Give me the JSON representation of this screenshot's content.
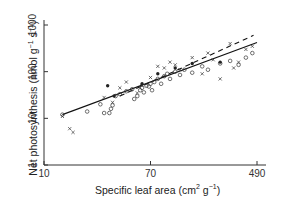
{
  "chart_data": {
    "type": "scatter",
    "title": "",
    "xlabel": "Specific leaf area (cm² g⁻¹)",
    "ylabel": "Net photosynthesis (nmol g⁻¹ s⁻¹)",
    "xscale": "log",
    "yscale": "log",
    "xlim": [
      10,
      560
    ],
    "ylim": [
      1,
      1000
    ],
    "x_ticks": [
      10,
      70,
      490
    ],
    "y_ticks": [
      1,
      10,
      100,
      1000
    ],
    "grid": false,
    "legend": "none",
    "series": [
      {
        "name": "open circles",
        "marker": "o",
        "points": [
          [
            14,
            12
          ],
          [
            22,
            14
          ],
          [
            28,
            20
          ],
          [
            30,
            13
          ],
          [
            33,
            13
          ],
          [
            34,
            16
          ],
          [
            35,
            19
          ],
          [
            37,
            30
          ],
          [
            40,
            33
          ],
          [
            45,
            38
          ],
          [
            50,
            42
          ],
          [
            52,
            26
          ],
          [
            55,
            30
          ],
          [
            58,
            40
          ],
          [
            60,
            45
          ],
          [
            62,
            36
          ],
          [
            65,
            50
          ],
          [
            68,
            48
          ],
          [
            70,
            55
          ],
          [
            72,
            40
          ],
          [
            75,
            60
          ],
          [
            80,
            70
          ],
          [
            85,
            55
          ],
          [
            90,
            80
          ],
          [
            95,
            90
          ],
          [
            100,
            70
          ],
          [
            110,
            100
          ],
          [
            120,
            85
          ],
          [
            130,
            110
          ],
          [
            150,
            95
          ],
          [
            180,
            130
          ],
          [
            200,
            110
          ],
          [
            250,
            150
          ],
          [
            300,
            170
          ],
          [
            350,
            140
          ],
          [
            400,
            200
          ],
          [
            450,
            250
          ]
        ]
      },
      {
        "name": "crosses",
        "marker": "x",
        "points": [
          [
            14,
            11
          ],
          [
            16,
            6
          ],
          [
            17,
            5
          ],
          [
            30,
            28
          ],
          [
            35,
            22
          ],
          [
            40,
            45
          ],
          [
            45,
            60
          ],
          [
            55,
            35
          ],
          [
            60,
            50
          ],
          [
            70,
            75
          ],
          [
            80,
            130
          ],
          [
            90,
            120
          ],
          [
            100,
            160
          ],
          [
            110,
            140
          ],
          [
            120,
            110
          ],
          [
            150,
            200
          ],
          [
            180,
            90
          ],
          [
            200,
            250
          ],
          [
            220,
            180
          ],
          [
            250,
            70
          ],
          [
            300,
            400
          ],
          [
            320,
            120
          ],
          [
            350,
            160
          ],
          [
            400,
            300
          ],
          [
            450,
            350
          ]
        ]
      },
      {
        "name": "filled points",
        "marker": "•",
        "points": [
          [
            32,
            50
          ],
          [
            36,
            30
          ],
          [
            60,
            55
          ],
          [
            80,
            90
          ],
          [
            110,
            120
          ],
          [
            150,
            150
          ],
          [
            250,
            160
          ]
        ]
      }
    ],
    "fit_lines": [
      {
        "name": "solid fit",
        "style": "solid",
        "from": [
          14,
          12
        ],
        "to": [
          490,
          420
        ]
      },
      {
        "name": "dashed fit",
        "style": "dashed",
        "from": [
          40,
          30
        ],
        "to": [
          460,
          600
        ]
      }
    ]
  },
  "axes": {
    "x_tick_labels": [
      "10",
      "70",
      "490"
    ],
    "y_tick_labels": [
      "1",
      "10",
      "100",
      "1000"
    ],
    "xlabel_text": "Specific leaf area (cm",
    "xlabel_sup1": "2",
    "xlabel_mid": " g",
    "xlabel_sup2": "−1",
    "xlabel_end": ")",
    "ylabel_text": "Net photosynthesis (nmol g",
    "ylabel_sup1": "−1",
    "ylabel_mid": " s",
    "ylabel_sup2": "−1",
    "ylabel_end": ")"
  }
}
